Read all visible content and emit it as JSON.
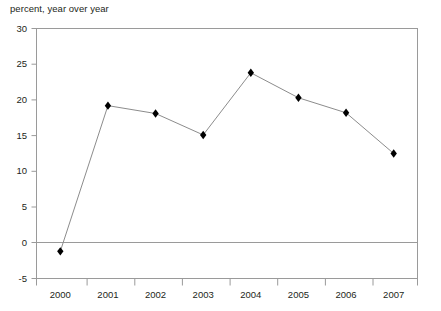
{
  "chart_data": {
    "type": "line",
    "title": "percent, year over year",
    "xlabel": "",
    "ylabel": "",
    "categories": [
      "2000",
      "2001",
      "2002",
      "2003",
      "2004",
      "2005",
      "2006",
      "2007"
    ],
    "values": [
      -1.2,
      19.2,
      18.1,
      15.1,
      23.8,
      20.3,
      18.2,
      12.5
    ],
    "series": [
      {
        "name": "percent, year over year",
        "values": [
          -1.2,
          19.2,
          18.1,
          15.1,
          23.8,
          20.3,
          18.2,
          12.5
        ]
      }
    ],
    "ylim": [
      -5,
      30
    ],
    "yticks": [
      30,
      25,
      20,
      15,
      10,
      5,
      0,
      -5
    ],
    "ytick_labels": [
      "30",
      "25",
      "20",
      "15",
      "10",
      "5",
      "0",
      "-5"
    ],
    "xtick_labels": [
      "2000",
      "2001",
      "2002",
      "2003",
      "2004",
      "2005",
      "2006",
      "2007"
    ],
    "grid": false,
    "zero_line": true,
    "legend": "none",
    "marker": "diamond",
    "line_color": "#8c8c8c",
    "marker_color": "#000000",
    "axis_color": "#9a9a9a",
    "text_color": "#231f20",
    "background": "#ffffff"
  },
  "axis": {
    "title": "percent, year over year"
  }
}
